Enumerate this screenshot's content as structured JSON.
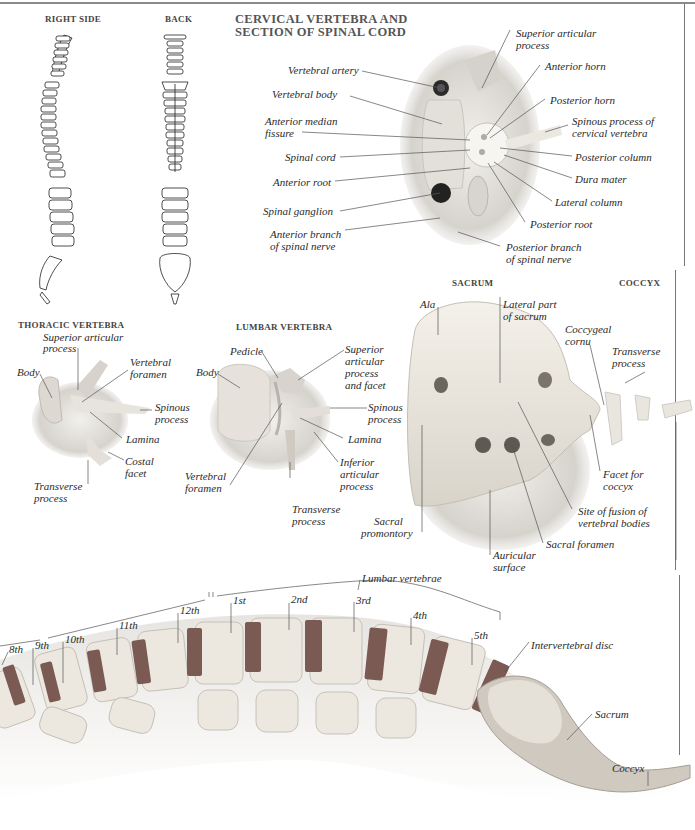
{
  "page": {
    "sections": {
      "right_side": "RIGHT SIDE",
      "back": "BACK",
      "cervical_title_1": "CERVICAL VERTEBRA AND",
      "cervical_title_2": "SECTION OF SPINAL CORD",
      "thoracic": "THORACIC VERTEBRA",
      "lumbar": "LUMBAR VERTEBRA",
      "sacrum": "SACRUM",
      "coccyx": "COCCYX"
    },
    "cervical_labels": {
      "vertebral_artery": "Vertebral artery",
      "vertebral_body": "Vertebral body",
      "anterior_median_1": "Anterior median",
      "anterior_median_2": "fissure",
      "spinal_cord": "Spinal cord",
      "anterior_root": "Anterior root",
      "spinal_ganglion": "Spinal ganglion",
      "anterior_branch_1": "Anterior branch",
      "anterior_branch_2": "of spinal nerve",
      "superior_articular_1": "Superior articular",
      "superior_articular_2": "process",
      "anterior_horn": "Anterior horn",
      "posterior_horn": "Posterior horn",
      "spinous_1": "Spinous process of",
      "spinous_2": "cervical vertebra",
      "posterior_column": "Posterior column",
      "dura_mater": "Dura mater",
      "lateral_column": "Lateral column",
      "posterior_root": "Posterior root",
      "posterior_branch_1": "Posterior branch",
      "posterior_branch_2": "of spinal nerve"
    },
    "thoracic_labels": {
      "superior_articular_1": "Superior articular",
      "superior_articular_2": "process",
      "body": "Body",
      "vertebral_foramen_1": "Vertebral",
      "vertebral_foramen_2": "foramen",
      "spinous_1": "Spinous",
      "spinous_2": "process",
      "lamina": "Lamina",
      "costal_1": "Costal",
      "costal_2": "facet",
      "transverse_1": "Transverse",
      "transverse_2": "process"
    },
    "lumbar_labels": {
      "pedicle": "Pedicle",
      "body": "Body",
      "superior_1": "Superior",
      "superior_2": "articular",
      "superior_3": "process",
      "superior_4": "and facet",
      "spinous_1": "Spinous",
      "spinous_2": "process",
      "lamina": "Lamina",
      "inferior_1": "Inferior",
      "inferior_2": "articular",
      "inferior_3": "process",
      "foramen_1": "Vertebral",
      "foramen_2": "foramen",
      "transverse_1": "Transverse",
      "transverse_2": "process"
    },
    "sacrum_labels": {
      "ala": "Ala",
      "lateral_part_1": "Lateral part",
      "lateral_part_2": "of sacrum",
      "coccygeal_1": "Coccygeal",
      "coccygeal_2": "cornu",
      "transverse_1": "Transverse",
      "transverse_2": "process",
      "facet_1": "Facet for",
      "facet_2": "coccyx",
      "fusion_1": "Site of fusion of",
      "fusion_2": "vertebral bodies",
      "sacral_foramen": "Sacral foramen",
      "auricular_1": "Auricular",
      "auricular_2": "surface",
      "promontory_1": "Sacral",
      "promontory_2": "promontory"
    },
    "column_labels": {
      "lumbar_vertebrae": "Lumbar vertebrae",
      "thoracic": [
        "8th",
        "9th",
        "10th",
        "11th",
        "12th"
      ],
      "lumbar": [
        "1st",
        "2nd",
        "3rd",
        "4th",
        "5th"
      ],
      "intervertebral_disc": "Intervertebral disc",
      "sacrum": "Sacrum",
      "coccyx": "Coccyx"
    },
    "colors": {
      "bone": "#ece8e0",
      "disc": "#7a5a52",
      "line": "#555555",
      "text": "#2a2a2a"
    }
  }
}
